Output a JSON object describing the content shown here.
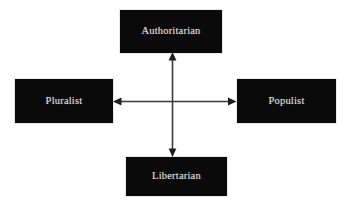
{
  "diagram": {
    "background_color": "#ffffff",
    "node_fill_color": "#0a0a0a",
    "node_text_color": "#e8e6e2",
    "axis_color": "#3a3a3a",
    "nodes": [
      {
        "id": "authoritarian",
        "label": "Authoritarian",
        "position": "top"
      },
      {
        "id": "pluralist",
        "label": "Pluralist",
        "position": "left"
      },
      {
        "id": "populist",
        "label": "Populist",
        "position": "right"
      },
      {
        "id": "libertarian",
        "label": "Libertarian",
        "position": "bottom"
      }
    ],
    "axes": [
      {
        "id": "vertical-axis",
        "orientation": "vertical",
        "from": "libertarian",
        "to": "authoritarian",
        "arrowheads": "both"
      },
      {
        "id": "horizontal-axis",
        "orientation": "horizontal",
        "from": "pluralist",
        "to": "populist",
        "arrowheads": "both"
      }
    ]
  }
}
